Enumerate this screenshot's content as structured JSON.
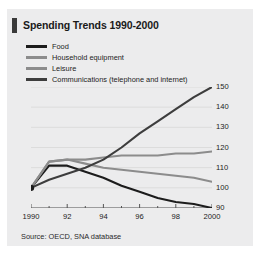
{
  "title": "Spending Trends 1990-2000",
  "source": "Source: OECD, SNA database",
  "colors": {
    "panel_background": "#ececed",
    "title_accent": "#3a3a3a",
    "food": "#1c1c1c",
    "household_equipment": "#8c8c8c",
    "leisure": "#8c8c8c",
    "communications": "#3d3d3d",
    "gridline": "#dcdcdc",
    "axis": "#555555"
  },
  "legend": {
    "items": [
      {
        "label": "Food",
        "color": "#1c1c1c"
      },
      {
        "label": "Household equipment",
        "color": "#8c8c8c"
      },
      {
        "label": "Leisure",
        "color": "#8c8c8c"
      },
      {
        "label": "Communications (telephone and internet)",
        "color": "#3d3d3d"
      }
    ]
  },
  "chart_data": {
    "type": "line",
    "title": "Spending Trends 1990-2000",
    "xlabel": "",
    "ylabel": "",
    "xlim": [
      1990,
      2000
    ],
    "ylim": [
      90,
      150
    ],
    "yticks": [
      90,
      100,
      110,
      120,
      130,
      140,
      150
    ],
    "ytick_labels": [
      "90",
      "100",
      "110",
      "120",
      "130",
      "140",
      "150"
    ],
    "ytick_side": "right",
    "x": [
      1990,
      1991,
      1992,
      1993,
      1994,
      1995,
      1996,
      1997,
      1998,
      1999,
      2000
    ],
    "xticks": [
      1990,
      1992,
      1994,
      1996,
      1998,
      2000
    ],
    "xtick_labels": [
      "1990",
      "92",
      "94",
      "96",
      "98",
      "2000"
    ],
    "minor_xticks": [
      1991,
      1993,
      1995,
      1997,
      1999
    ],
    "grid": true,
    "legend_position": "top-left",
    "series": [
      {
        "name": "Food",
        "color": "#1c1c1c",
        "values": [
          100,
          111,
          111,
          108,
          105,
          101,
          98,
          95,
          93,
          92,
          90
        ]
      },
      {
        "name": "Household equipment",
        "color": "#8c8c8c",
        "values": [
          100,
          113,
          114,
          114,
          115,
          116,
          116,
          116,
          117,
          117,
          118
        ]
      },
      {
        "name": "Leisure",
        "color": "#8c8c8c",
        "values": [
          100,
          113,
          114,
          112,
          110,
          109,
          108,
          107,
          106,
          105,
          103
        ]
      },
      {
        "name": "Communications (telephone and internet)",
        "color": "#3d3d3d",
        "values": [
          100,
          104,
          107,
          110,
          114,
          120,
          127,
          133,
          139,
          145,
          150
        ]
      }
    ]
  }
}
